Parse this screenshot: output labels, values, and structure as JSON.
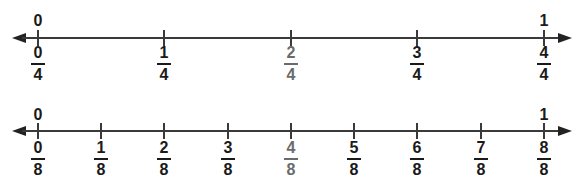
{
  "colors": {
    "line": "#3a3a3a",
    "text": "#1a1a1a",
    "highlight": "#6b6b6b"
  },
  "number_lines": [
    {
      "name": "fourths",
      "whole_labels": {
        "start": "0",
        "end": "1"
      },
      "ticks": [
        {
          "num": "0",
          "den": "4",
          "highlight": false
        },
        {
          "num": "1",
          "den": "4",
          "highlight": false
        },
        {
          "num": "2",
          "den": "4",
          "highlight": true
        },
        {
          "num": "3",
          "den": "4",
          "highlight": false
        },
        {
          "num": "4",
          "den": "4",
          "highlight": false
        }
      ]
    },
    {
      "name": "eighths",
      "whole_labels": {
        "start": "0",
        "end": "1"
      },
      "ticks": [
        {
          "num": "0",
          "den": "8",
          "highlight": false
        },
        {
          "num": "1",
          "den": "8",
          "highlight": false
        },
        {
          "num": "2",
          "den": "8",
          "highlight": false
        },
        {
          "num": "3",
          "den": "8",
          "highlight": false
        },
        {
          "num": "4",
          "den": "8",
          "highlight": true
        },
        {
          "num": "5",
          "den": "8",
          "highlight": false
        },
        {
          "num": "6",
          "den": "8",
          "highlight": false
        },
        {
          "num": "7",
          "den": "8",
          "highlight": false
        },
        {
          "num": "8",
          "den": "8",
          "highlight": false
        }
      ]
    }
  ]
}
